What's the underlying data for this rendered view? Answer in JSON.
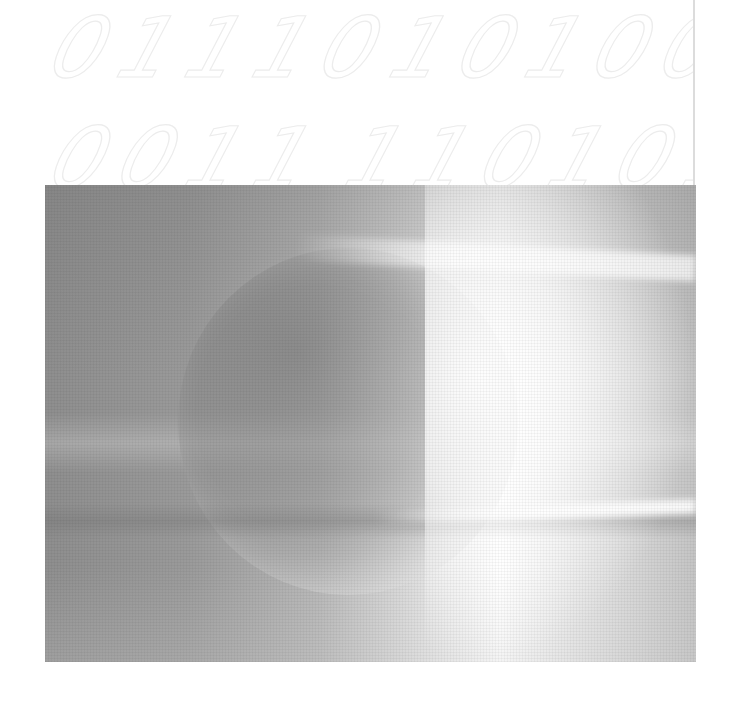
{
  "decorative_binary": {
    "row1_left": "01110",
    "row1_right": "1010000",
    "row2_left": "0011",
    "row2_right": "1101010",
    "stroke_color": "#ececec"
  },
  "photo": {
    "subject": "grayscale sphere with bright light streaks",
    "palette": {
      "dark_gray": "#8e8e8e",
      "mid_gray": "#b6b6b6",
      "highlight": "#ffffff"
    }
  },
  "page_edge_color": "#dcdcdc"
}
